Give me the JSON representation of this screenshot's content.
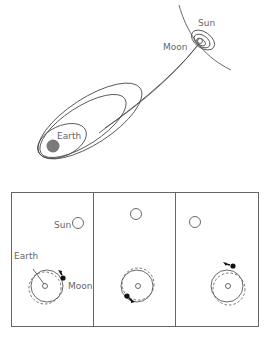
{
  "top_diagram": {
    "labels": {
      "sun": "Sun",
      "moon": "Moon",
      "earth": "Earth"
    },
    "colors": {
      "earth_fill": "#7a7a7a",
      "line": "#444444",
      "label": "#666666"
    }
  },
  "bottom_diagram": {
    "panels": [
      {
        "labels": {
          "sun": "Sun",
          "earth": "Earth",
          "moon": "Moon"
        },
        "moon_position": "upper-right"
      },
      {
        "labels": {},
        "moon_position": "lower-left"
      },
      {
        "labels": {},
        "moon_position": "top"
      }
    ]
  }
}
